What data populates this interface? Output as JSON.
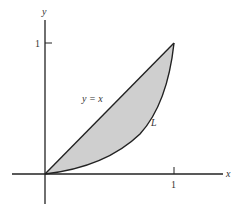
{
  "figure": {
    "axes": {
      "x_label": "x",
      "y_label": "y",
      "x_tick_label": "1",
      "y_tick_label": "1"
    },
    "curves": {
      "line_label": "y = x",
      "curve_label": "L"
    },
    "colors": {
      "stroke": "#222222",
      "fill": "#cfcfcf",
      "background": "#ffffff"
    }
  }
}
